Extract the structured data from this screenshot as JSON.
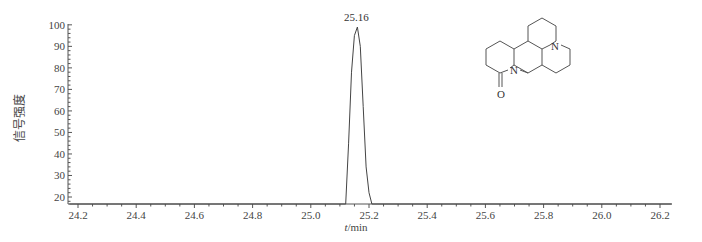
{
  "chart_data": {
    "type": "line",
    "title": "",
    "xlabel": "t/min",
    "ylabel": "信号强度",
    "xlim": [
      24.17,
      26.24
    ],
    "ylim": [
      16.5,
      100
    ],
    "x_ticks": [
      "24.2",
      "24.4",
      "24.6",
      "24.8",
      "25.0",
      "25.2",
      "25.4",
      "25.6",
      "25.8",
      "26.0",
      "26.2"
    ],
    "y_ticks": [
      "20",
      "30",
      "40",
      "50",
      "60",
      "70",
      "80",
      "90",
      "100"
    ],
    "grid": false,
    "legend": null,
    "series": [
      {
        "name": "chromatogram",
        "x": [
          24.17,
          25.12,
          25.13,
          25.14,
          25.15,
          25.16,
          25.17,
          25.18,
          25.19,
          25.2,
          25.21,
          26.24
        ],
        "y": [
          16.5,
          16.5,
          45,
          78,
          95,
          99,
          90,
          62,
          34,
          22,
          16.5,
          16.5
        ]
      }
    ],
    "annotations": [
      {
        "text": "25.16",
        "x": 25.16,
        "y": 99,
        "type": "peak-label"
      }
    ],
    "inset": {
      "type": "chemical-structure",
      "description": "oxymatrine/matrine-type tetracyclic quinolizidine alkaloid with lactam carbonyl",
      "atom_labels": [
        "N",
        "N",
        "O"
      ]
    }
  }
}
